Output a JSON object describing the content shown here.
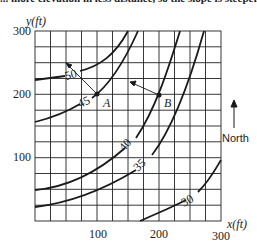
{
  "caption_fragment": "... more elevation in less distance, so the slope is steeper.",
  "axes": {
    "y_label": "y(ft)",
    "x_label": "x(ft)",
    "y_ticks": [
      "300",
      "200",
      "100"
    ],
    "x_ticks": [
      "100",
      "200",
      "300"
    ]
  },
  "points": {
    "a": "A",
    "b": "B"
  },
  "contours": {
    "c50": "50",
    "c45": "45",
    "c40": "40",
    "c35": "35",
    "c30": "30"
  },
  "compass": {
    "label": "North"
  },
  "colors": {
    "line": "#1a1a1a",
    "grid": "#222222",
    "background": "#ffffff"
  }
}
